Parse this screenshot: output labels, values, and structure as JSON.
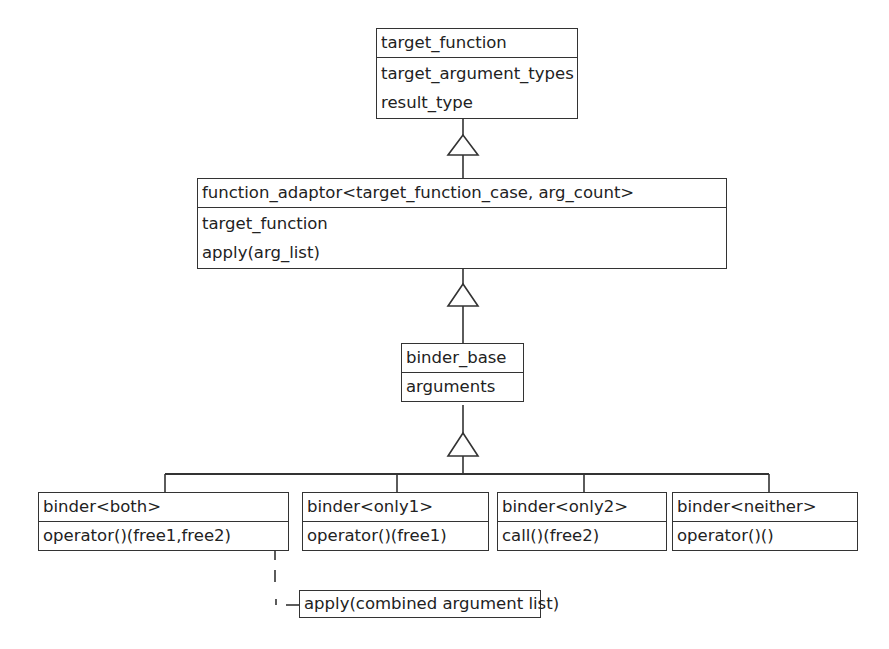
{
  "diagram": {
    "type": "UML class diagram",
    "classes": [
      {
        "id": "target_function",
        "name": "target_function",
        "members": [
          "target_argument_types",
          "result_type"
        ]
      },
      {
        "id": "function_adaptor",
        "name": "function_adaptor<target_function_case, arg_count>",
        "members": [
          "target_function",
          "apply(arg_list)"
        ]
      },
      {
        "id": "binder_base",
        "name": "binder_base",
        "members": [
          "arguments"
        ]
      },
      {
        "id": "binder_both",
        "name": "binder<both>",
        "members": [
          "operator()(free1,free2)"
        ]
      },
      {
        "id": "binder_only1",
        "name": "binder<only1>",
        "members": [
          "operator()(free1)"
        ]
      },
      {
        "id": "binder_only2",
        "name": "binder<only2>",
        "members": [
          "call()(free2)"
        ]
      },
      {
        "id": "binder_neither",
        "name": "binder<neither>",
        "members": [
          "operator()()"
        ]
      }
    ],
    "note": {
      "text": "apply(combined argument list)",
      "attached_to": "binder_both.operator()(free1,free2)"
    },
    "relations": [
      {
        "type": "generalization",
        "from": "function_adaptor",
        "to": "target_function"
      },
      {
        "type": "generalization",
        "from": "binder_base",
        "to": "function_adaptor"
      },
      {
        "type": "generalization",
        "from": "binder_both",
        "to": "binder_base"
      },
      {
        "type": "generalization",
        "from": "binder_only1",
        "to": "binder_base"
      },
      {
        "type": "generalization",
        "from": "binder_only2",
        "to": "binder_base"
      },
      {
        "type": "generalization",
        "from": "binder_neither",
        "to": "binder_base"
      },
      {
        "type": "note-link",
        "from": "binder_both",
        "to": "note"
      }
    ]
  }
}
